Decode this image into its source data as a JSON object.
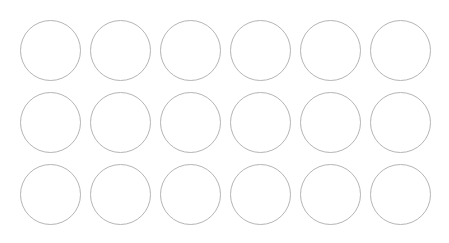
{
  "canvas": {
    "width": 449,
    "height": 243,
    "background_color": "#ffffff"
  },
  "grid": {
    "name": "circle-grid",
    "columns": 6,
    "rows": 3,
    "total_circles": 18,
    "margin_left": 20,
    "margin_top": 20,
    "margin_right": 17,
    "margin_bottom": 17,
    "column_pitch": 70,
    "row_pitch": 72,
    "circle_diameter": 61,
    "column_origins_x": [
      20,
      90,
      160,
      230,
      300,
      370
    ],
    "row_origins_y": [
      20,
      92,
      164
    ]
  },
  "circle_style": {
    "fill": "none",
    "stroke_color": "#b5b5b5",
    "stroke_width": 1,
    "shape": "circle",
    "label": ""
  },
  "circles": [
    {
      "id": "circle-r1-c1",
      "row": 1,
      "col": 1,
      "cx": 50.5,
      "cy": 50.5,
      "r": 30.5,
      "label": ""
    },
    {
      "id": "circle-r1-c2",
      "row": 1,
      "col": 2,
      "cx": 120.5,
      "cy": 50.5,
      "r": 30.5,
      "label": ""
    },
    {
      "id": "circle-r1-c3",
      "row": 1,
      "col": 3,
      "cx": 190.5,
      "cy": 50.5,
      "r": 30.5,
      "label": ""
    },
    {
      "id": "circle-r1-c4",
      "row": 1,
      "col": 4,
      "cx": 260.5,
      "cy": 50.5,
      "r": 30.5,
      "label": ""
    },
    {
      "id": "circle-r1-c5",
      "row": 1,
      "col": 5,
      "cx": 330.5,
      "cy": 50.5,
      "r": 30.5,
      "label": ""
    },
    {
      "id": "circle-r1-c6",
      "row": 1,
      "col": 6,
      "cx": 400.5,
      "cy": 50.5,
      "r": 30.5,
      "label": ""
    },
    {
      "id": "circle-r2-c1",
      "row": 2,
      "col": 1,
      "cx": 50.5,
      "cy": 122.5,
      "r": 30.5,
      "label": ""
    },
    {
      "id": "circle-r2-c2",
      "row": 2,
      "col": 2,
      "cx": 120.5,
      "cy": 122.5,
      "r": 30.5,
      "label": ""
    },
    {
      "id": "circle-r2-c3",
      "row": 2,
      "col": 3,
      "cx": 190.5,
      "cy": 122.5,
      "r": 30.5,
      "label": ""
    },
    {
      "id": "circle-r2-c4",
      "row": 2,
      "col": 4,
      "cx": 260.5,
      "cy": 122.5,
      "r": 30.5,
      "label": ""
    },
    {
      "id": "circle-r2-c5",
      "row": 2,
      "col": 5,
      "cx": 330.5,
      "cy": 122.5,
      "r": 30.5,
      "label": ""
    },
    {
      "id": "circle-r2-c6",
      "row": 2,
      "col": 6,
      "cx": 400.5,
      "cy": 122.5,
      "r": 30.5,
      "label": ""
    },
    {
      "id": "circle-r3-c1",
      "row": 3,
      "col": 1,
      "cx": 50.5,
      "cy": 194.5,
      "r": 30.5,
      "label": ""
    },
    {
      "id": "circle-r3-c2",
      "row": 3,
      "col": 2,
      "cx": 120.5,
      "cy": 194.5,
      "r": 30.5,
      "label": ""
    },
    {
      "id": "circle-r3-c3",
      "row": 3,
      "col": 3,
      "cx": 190.5,
      "cy": 194.5,
      "r": 30.5,
      "label": ""
    },
    {
      "id": "circle-r3-c4",
      "row": 3,
      "col": 4,
      "cx": 260.5,
      "cy": 194.5,
      "r": 30.5,
      "label": ""
    },
    {
      "id": "circle-r3-c5",
      "row": 3,
      "col": 5,
      "cx": 330.5,
      "cy": 194.5,
      "r": 30.5,
      "label": ""
    },
    {
      "id": "circle-r3-c6",
      "row": 3,
      "col": 6,
      "cx": 400.5,
      "cy": 194.5,
      "r": 30.5,
      "label": ""
    }
  ]
}
